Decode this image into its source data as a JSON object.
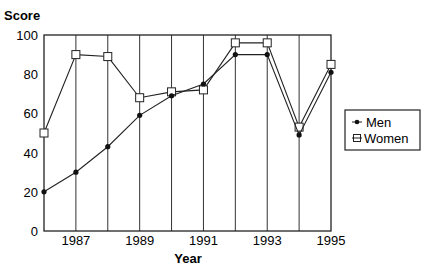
{
  "chart_data": {
    "type": "line",
    "title": "",
    "xlabel": "Year",
    "ylabel": "Score",
    "x": [
      1986,
      1987,
      1988,
      1989,
      1990,
      1991,
      1992,
      1993,
      1994,
      1995
    ],
    "x_tick_labels": [
      "1987",
      "1989",
      "1991",
      "1993",
      "1995"
    ],
    "y_tick_labels": [
      "0",
      "20",
      "40",
      "60",
      "80",
      "100"
    ],
    "ylim": [
      0,
      100
    ],
    "xlim": [
      1986,
      1995
    ],
    "grid": "vertical lines at each year",
    "legend_position": "right",
    "series": [
      {
        "name": "Men",
        "marker": "filled-circle",
        "values": [
          20,
          30,
          43,
          59,
          69,
          75,
          90,
          90,
          49,
          81
        ]
      },
      {
        "name": "Women",
        "marker": "open-square",
        "values": [
          50,
          90,
          89,
          68,
          71,
          72,
          96,
          96,
          53,
          85
        ]
      }
    ]
  },
  "labels": {
    "ylabel": "Score",
    "xlabel": "Year",
    "legend_men": "Men",
    "legend_women": "Women"
  },
  "colors": {
    "line": "#222222",
    "axis": "#222222",
    "background": "#ffffff"
  }
}
